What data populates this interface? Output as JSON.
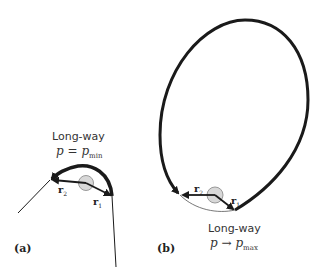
{
  "panels": [
    {
      "id": "a",
      "label": "(a)",
      "title": "Long-way",
      "condition": {
        "var": "p",
        "op": "=",
        "sub_var": "p",
        "sub": "min"
      },
      "vectors": [
        {
          "name": "r",
          "sub": "2"
        },
        {
          "name": "r",
          "sub": "1"
        }
      ]
    },
    {
      "id": "b",
      "label": "(b)",
      "title": "Long-way",
      "condition": {
        "var": "p",
        "op": "→",
        "sub_var": "p",
        "sub": "max"
      },
      "vectors": [
        {
          "name": "r",
          "sub": "2"
        },
        {
          "name": "r",
          "sub": "1"
        }
      ]
    }
  ],
  "colors": {
    "stroke": "#1a1a1a",
    "body_fill": "#d8d8d8",
    "body_stroke": "#999999",
    "text": "#333333"
  }
}
